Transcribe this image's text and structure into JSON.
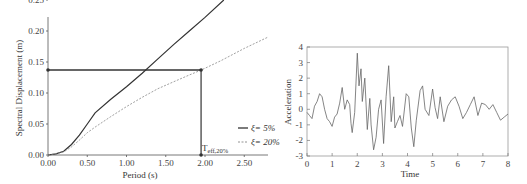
{
  "chart_data": [
    {
      "type": "line",
      "title": "",
      "xlabel": "Period (s)",
      "ylabel": "Spectral Displacement (m)",
      "xlim": [
        0,
        2.8
      ],
      "ylim": [
        0,
        0.25
      ],
      "xticks": [
        "0.00",
        "0.50",
        "1.00",
        "1.50",
        "2.00",
        "2.50"
      ],
      "yticks": [
        "0.00",
        "0.05",
        "0.10",
        "0.15",
        "0.20",
        "0.25"
      ],
      "grid": false,
      "legend_position": "right",
      "series": [
        {
          "name": "ξ= 5%",
          "style": "solid",
          "x": [
            0,
            0.1,
            0.2,
            0.3,
            0.4,
            0.5,
            0.6,
            0.8,
            1.0,
            1.2,
            1.4,
            1.6,
            1.8,
            2.0,
            2.24
          ],
          "y": [
            0,
            0.002,
            0.006,
            0.017,
            0.032,
            0.05,
            0.068,
            0.09,
            0.11,
            0.132,
            0.155,
            0.178,
            0.2,
            0.222,
            0.25
          ]
        },
        {
          "name": "ξ= 20%",
          "style": "dashed",
          "x": [
            0,
            0.1,
            0.2,
            0.3,
            0.4,
            0.5,
            0.6,
            0.8,
            1.0,
            1.2,
            1.4,
            1.6,
            1.8,
            1.95,
            2.2,
            2.5,
            2.8
          ],
          "y": [
            0,
            0.002,
            0.005,
            0.013,
            0.024,
            0.036,
            0.045,
            0.062,
            0.078,
            0.093,
            0.107,
            0.118,
            0.129,
            0.137,
            0.152,
            0.172,
            0.19
          ]
        }
      ],
      "annotations": {
        "target_displacement": 0.137,
        "effective_period": 1.95,
        "effective_period_label": "T",
        "effective_period_subscript": "eff,20%"
      }
    },
    {
      "type": "line",
      "title": "",
      "xlabel": "Time",
      "ylabel": "Acceleration",
      "xlim": [
        0,
        8
      ],
      "ylim": [
        -3,
        4
      ],
      "xticks": [
        "0",
        "1",
        "2",
        "3",
        "4",
        "5",
        "6",
        "7",
        "8"
      ],
      "yticks": [
        "-3",
        "-2",
        "-1",
        "0",
        "1",
        "2",
        "3",
        "4"
      ],
      "grid": false,
      "series": [
        {
          "name": "Acceleration record",
          "x": [
            0,
            0.1,
            0.2,
            0.3,
            0.4,
            0.5,
            0.6,
            0.7,
            0.8,
            0.9,
            1.0,
            1.1,
            1.2,
            1.3,
            1.4,
            1.5,
            1.6,
            1.7,
            1.75,
            1.8,
            1.9,
            2.0,
            2.07,
            2.15,
            2.2,
            2.3,
            2.4,
            2.5,
            2.55,
            2.65,
            2.75,
            2.85,
            2.95,
            3.05,
            3.15,
            3.25,
            3.35,
            3.45,
            3.5,
            3.6,
            3.7,
            3.8,
            3.95,
            4.05,
            4.15,
            4.25,
            4.35,
            4.5,
            4.6,
            4.7,
            4.85,
            5.0,
            5.1,
            5.2,
            5.3,
            5.45,
            5.6,
            5.75,
            5.9,
            6.05,
            6.2,
            6.35,
            6.5,
            6.65,
            6.8,
            6.95,
            7.1,
            7.25,
            7.4,
            7.55,
            7.7,
            7.85,
            8.0
          ],
          "y": [
            -0.2,
            -0.4,
            -0.6,
            0.2,
            0.5,
            1.0,
            0.8,
            0.0,
            -0.6,
            -0.8,
            -1.1,
            -0.5,
            -0.3,
            0.4,
            1.4,
            0.0,
            0.6,
            0.3,
            -0.9,
            -1.5,
            -0.2,
            3.6,
            1.5,
            2.6,
            0.5,
            2.0,
            -1.3,
            0.7,
            -1.0,
            -2.6,
            -1.8,
            0.0,
            0.6,
            -2.2,
            0.8,
            2.8,
            -0.8,
            0.8,
            -1.2,
            -0.8,
            -0.4,
            -1.1,
            1.0,
            0.8,
            -1.2,
            -2.4,
            -0.7,
            1.2,
            1.5,
            0.0,
            -0.4,
            1.3,
            0.1,
            -0.6,
            0.8,
            -0.8,
            0.2,
            0.6,
            0.8,
            0.2,
            -0.6,
            -0.2,
            0.3,
            0.8,
            -0.4,
            0.4,
            0.3,
            0.0,
            0.3,
            -0.2,
            -0.7,
            -0.5,
            -0.3
          ]
        }
      ]
    }
  ],
  "legend": {
    "item1": "ξ= 5%",
    "item2": "ξ= 20%"
  },
  "labels": {
    "left_xlabel": "Period (s)",
    "left_ylabel": "Spectral Displacement (m)",
    "teff_main": "T",
    "teff_sub": "eff,20%",
    "right_xlabel": "Time",
    "right_ylabel": "Acceleration"
  }
}
